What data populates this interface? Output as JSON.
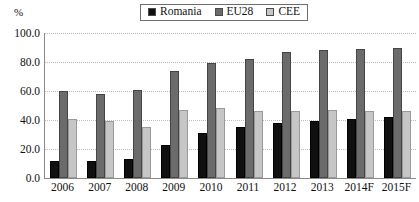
{
  "legend": {
    "position": "top-center",
    "entries": [
      {
        "label": "Romania",
        "color": "#101010",
        "icon": "legend-swatch-icon"
      },
      {
        "label": "EU28",
        "color": "#6b6b6b",
        "icon": "legend-swatch-icon"
      },
      {
        "label": "CEE",
        "color": "#c6c6c6",
        "icon": "legend-swatch-icon"
      }
    ]
  },
  "axis_unit": "%",
  "chart_data": {
    "type": "bar",
    "title": "",
    "subtitle": "",
    "xlabel": "",
    "ylabel": "%",
    "ylim": [
      0,
      100
    ],
    "ytick_labels": [
      "100.0",
      "80.0",
      "60.0",
      "40.0",
      "20.0",
      "0.0"
    ],
    "ytick_values": [
      100,
      80,
      60,
      40,
      20,
      0
    ],
    "grid": true,
    "legend_position": "top-center",
    "categories": [
      "2006",
      "2007",
      "2008",
      "2009",
      "2010",
      "2011",
      "2012",
      "2013",
      "2014F",
      "2015F"
    ],
    "series": [
      {
        "name": "Romania",
        "color": "#101010",
        "values": [
          12,
          12,
          13,
          23,
          31,
          35,
          38,
          39,
          41,
          42
        ]
      },
      {
        "name": "EU28",
        "color": "#6b6b6b",
        "values": [
          60,
          58,
          61,
          74,
          79,
          82,
          87,
          88,
          89,
          90
        ]
      },
      {
        "name": "CEE",
        "color": "#c6c6c6",
        "values": [
          41,
          39,
          35,
          47,
          48,
          46,
          46,
          47,
          46,
          46
        ]
      }
    ]
  }
}
